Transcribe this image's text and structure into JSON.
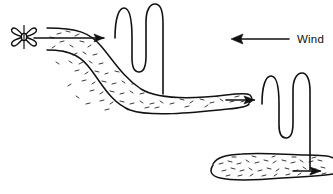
{
  "figure": {
    "type": "technical-line-diagram",
    "background_color": "#ffffff",
    "stroke_color": "#111111",
    "title": "",
    "annotations": {
      "wind_label": "Wind"
    },
    "elements": {
      "fan": {
        "name": "four-blade fan",
        "center_x": 24,
        "center_y": 37,
        "blade_count": 4
      },
      "wind_arrow": {
        "direction": "left",
        "x_start": 289,
        "x_end": 231,
        "y": 39
      },
      "plume_upper": {
        "description": "stippled plume from fan sweeping down to the right"
      },
      "plume_lower": {
        "description": "stippled plume at lower right"
      },
      "flow_arrows": 3,
      "serpentine_stacks": 2
    }
  }
}
